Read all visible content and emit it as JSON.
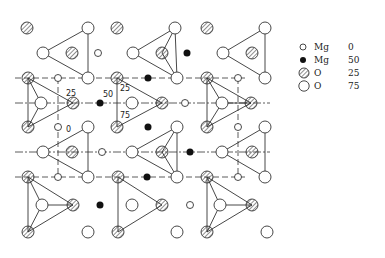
{
  "diagram": {
    "title": "",
    "annotations": [
      {
        "text": "25",
        "x": 68,
        "y": 96
      },
      {
        "text": "50",
        "x": 104,
        "y": 96
      },
      {
        "text": "25",
        "x": 119,
        "y": 91
      },
      {
        "text": "75",
        "x": 120,
        "y": 118
      },
      {
        "text": "0",
        "x": 66,
        "y": 131
      }
    ],
    "legend": [
      {
        "symbol": "small-open-circle",
        "label": "Mg",
        "value": "0"
      },
      {
        "symbol": "filled-circle",
        "label": "Mg",
        "value": "50"
      },
      {
        "symbol": "hatched-circle",
        "label": "O",
        "value": "25"
      },
      {
        "symbol": "large-open-circle",
        "label": "O",
        "value": "75"
      }
    ],
    "colors": {
      "line": "#333333",
      "fill_black": "#111111",
      "background": "#ffffff"
    }
  }
}
